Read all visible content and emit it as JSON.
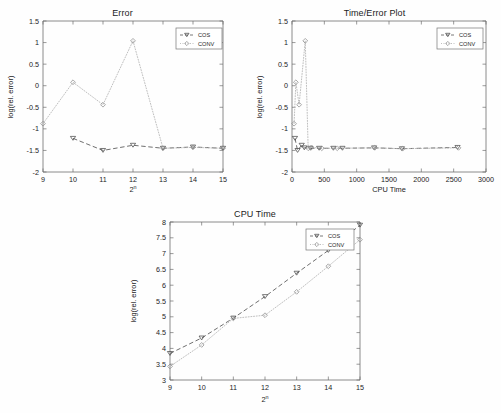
{
  "figure": {
    "background": "#ffffff",
    "series_colors": {
      "cos": "#555555",
      "conv": "#b4b4b4"
    }
  },
  "legend": {
    "entries": [
      {
        "label": "COS",
        "marker": "triangle-down-marker",
        "line": "dashed"
      },
      {
        "label": "CONV",
        "marker": "diamond-marker",
        "line": "dotted"
      }
    ]
  },
  "chart_data": [
    {
      "type": "line",
      "id": "error-plot",
      "title": "Error",
      "xlabel": "2^n",
      "xlabel_base": "2",
      "xlabel_exp": "n",
      "ylabel": "log(rel. error)",
      "xlim": [
        9,
        15
      ],
      "ylim": [
        -2,
        1.5
      ],
      "xticks": [
        9,
        10,
        11,
        12,
        13,
        14,
        15
      ],
      "xticklabels": [
        "9",
        "10",
        "11",
        "12",
        "13",
        "14",
        "15"
      ],
      "yticks": [
        -2,
        -1.5,
        -1,
        -0.5,
        0,
        0.5,
        1,
        1.5
      ],
      "yticklabels": [
        "-2",
        "-1.5",
        "-1",
        "-0.5",
        "0",
        "0.5",
        "1",
        "1.5"
      ],
      "grid": false,
      "legend_position": "top-right",
      "x": [
        9,
        10,
        11,
        12,
        13,
        14,
        15
      ],
      "series": [
        {
          "name": "COS",
          "values": [
            null,
            -1.22,
            -1.5,
            -1.38,
            -1.45,
            -1.42,
            -1.45
          ]
        },
        {
          "name": "CONV",
          "values": [
            -0.88,
            0.08,
            -0.44,
            1.04,
            -1.45,
            -1.43,
            -1.45
          ]
        }
      ]
    },
    {
      "type": "line",
      "id": "time-error-plot",
      "title": "Time/Error Plot",
      "xlabel": "CPU Time",
      "ylabel": "log(rel. error)",
      "xlim": [
        0,
        3000
      ],
      "ylim": [
        -2,
        1.5
      ],
      "xticks": [
        0,
        500,
        1000,
        1500,
        2000,
        2500,
        3000
      ],
      "xticklabels": [
        "0",
        "500",
        "1000",
        "1500",
        "2000",
        "2500",
        "3000"
      ],
      "yticks": [
        -2,
        -1.5,
        -1,
        -0.5,
        0,
        0.5,
        1,
        1.5
      ],
      "yticklabels": [
        "-2",
        "-1.5",
        "-1",
        "-0.5",
        "0",
        "0.5",
        "1",
        "1.5"
      ],
      "grid": false,
      "legend_position": "top-right",
      "series": [
        {
          "name": "COS",
          "points": [
            [
              46,
              -1.22
            ],
            [
              86,
              -1.5
            ],
            [
              150,
              -1.38
            ],
            [
              190,
              -1.44
            ],
            [
              285,
              -1.45
            ],
            [
              420,
              -1.45
            ],
            [
              640,
              -1.45
            ],
            [
              780,
              -1.45
            ],
            [
              1270,
              -1.44
            ],
            [
              1700,
              -1.46
            ],
            [
              2560,
              -1.43
            ]
          ]
        },
        {
          "name": "CONV",
          "points": [
            [
              32,
              -0.88
            ],
            [
              60,
              0.08
            ],
            [
              110,
              -0.44
            ],
            [
              205,
              1.04
            ],
            [
              250,
              -1.45
            ],
            [
              300,
              -1.43
            ],
            [
              460,
              -1.45
            ],
            [
              700,
              -1.45
            ],
            [
              1280,
              -1.44
            ],
            [
              1710,
              -1.46
            ],
            [
              2575,
              -1.44
            ]
          ]
        }
      ]
    },
    {
      "type": "line",
      "id": "cpu-time-plot",
      "title": "CPU Time",
      "xlabel": "2^n",
      "xlabel_base": "2",
      "xlabel_exp": "n",
      "ylabel": "log(rel. error)",
      "xlim": [
        9,
        15
      ],
      "ylim": [
        3,
        8
      ],
      "xticks": [
        9,
        10,
        11,
        12,
        13,
        14,
        15
      ],
      "xticklabels": [
        "9",
        "10",
        "11",
        "12",
        "13",
        "14",
        "15"
      ],
      "yticks": [
        3,
        3.5,
        4,
        4.5,
        5,
        5.5,
        6,
        6.5,
        7,
        7.5,
        8
      ],
      "yticklabels": [
        "3",
        "3.5",
        "4",
        "4.5",
        "5",
        "5.5",
        "6",
        "6.5",
        "7",
        "7.5",
        "8"
      ],
      "grid": false,
      "legend_position": "top-right",
      "x": [
        9,
        10,
        11,
        12,
        13,
        14,
        15
      ],
      "series": [
        {
          "name": "COS",
          "values": [
            3.84,
            4.33,
            4.96,
            5.64,
            6.38,
            7.1,
            7.9
          ]
        },
        {
          "name": "CONV",
          "values": [
            3.43,
            4.11,
            4.95,
            5.05,
            5.79,
            6.6,
            7.44
          ]
        }
      ]
    }
  ]
}
